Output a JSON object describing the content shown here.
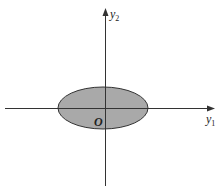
{
  "diagram": {
    "type": "coordinate-plane-with-ellipse",
    "axes": {
      "horizontal": {
        "label": "y",
        "subscript": "1"
      },
      "vertical": {
        "label": "y",
        "subscript": "2"
      },
      "origin_label": "O"
    },
    "region": {
      "shape": "ellipse",
      "fill_color": "#a9a9a9",
      "stroke_color": "#333333"
    },
    "colors": {
      "axis": "#333333",
      "background": "#ffffff"
    }
  }
}
